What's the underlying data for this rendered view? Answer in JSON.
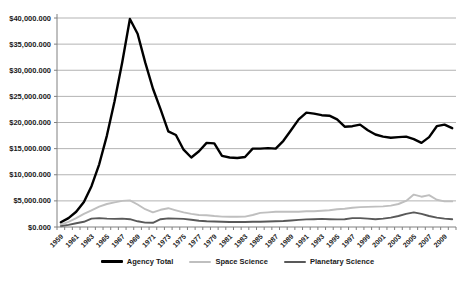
{
  "chart_data": {
    "type": "line",
    "title": "",
    "xlabel": "",
    "ylabel": "",
    "ylim": [
      0,
      40000
    ],
    "grid": "horizontal",
    "legend_position": "bottom",
    "axis_color": "#808080",
    "gridline_color": "#b3b3b3",
    "text_color": "#1a1a1a",
    "y_ticks": [
      0,
      5000,
      10000,
      15000,
      20000,
      25000,
      30000,
      35000,
      40000
    ],
    "y_tick_labels": [
      "$0.000",
      "$5,000.000",
      "$10,000.000",
      "$15,000.000",
      "$20,000.000",
      "$25,000.000",
      "$30,000.000",
      "$35,000.000",
      "$40,000.000"
    ],
    "x": [
      1959,
      1960,
      1961,
      1962,
      1963,
      1964,
      1965,
      1966,
      1967,
      1968,
      1969,
      1970,
      1971,
      1972,
      1973,
      1974,
      1975,
      1976,
      1977,
      1978,
      1979,
      1980,
      1981,
      1982,
      1983,
      1984,
      1985,
      1986,
      1987,
      1988,
      1989,
      1990,
      1991,
      1992,
      1993,
      1994,
      1995,
      1996,
      1997,
      1998,
      1999,
      2000,
      2001,
      2002,
      2003,
      2004,
      2005,
      2006,
      2007,
      2008,
      2009,
      2010
    ],
    "x_tick_labels": [
      "1959",
      "1961",
      "1963",
      "1965",
      "1967",
      "1969",
      "1971",
      "1973",
      "1975",
      "1977",
      "1979",
      "1981",
      "1983",
      "1985",
      "1987",
      "1989",
      "1991",
      "1993",
      "1995",
      "1997",
      "1999",
      "2001",
      "2003",
      "2005",
      "2007",
      "2009"
    ],
    "series": [
      {
        "name": "Agency Total",
        "color": "#000000",
        "stroke_width": 2.4,
        "values": [
          900,
          1700,
          2900,
          4800,
          7800,
          12000,
          17500,
          24000,
          31500,
          39800,
          37000,
          31500,
          26500,
          22500,
          18300,
          17600,
          14800,
          13300,
          14500,
          16100,
          16000,
          13600,
          13300,
          13200,
          13400,
          15000,
          15000,
          15100,
          15000,
          16500,
          18500,
          20600,
          21900,
          21700,
          21400,
          21300,
          20600,
          19200,
          19300,
          19600,
          18500,
          17700,
          17300,
          17100,
          17200,
          17300,
          16800,
          16100,
          17200,
          19300,
          19600,
          18900
        ]
      },
      {
        "name": "Space Science",
        "color": "#bfbfbf",
        "stroke_width": 1.9,
        "values": [
          450,
          1000,
          1700,
          2500,
          3200,
          3900,
          4400,
          4700,
          5000,
          5100,
          4300,
          3400,
          2800,
          3300,
          3600,
          3200,
          2800,
          2500,
          2300,
          2250,
          2100,
          2000,
          1950,
          1950,
          2000,
          2300,
          2700,
          2800,
          2900,
          2900,
          2900,
          2900,
          3000,
          3000,
          3100,
          3200,
          3400,
          3500,
          3700,
          3800,
          3850,
          3900,
          3950,
          4100,
          4400,
          5000,
          6200,
          5800,
          6100,
          5200,
          4900,
          4900
        ]
      },
      {
        "name": "Planetary Science",
        "color": "#595959",
        "stroke_width": 1.9,
        "values": [
          150,
          400,
          700,
          1000,
          1600,
          1700,
          1600,
          1550,
          1600,
          1500,
          1100,
          850,
          800,
          1500,
          1650,
          1600,
          1550,
          1400,
          1200,
          1100,
          1050,
          1000,
          950,
          950,
          950,
          1000,
          1000,
          1050,
          1100,
          1150,
          1250,
          1350,
          1450,
          1500,
          1550,
          1500,
          1450,
          1500,
          1700,
          1700,
          1600,
          1500,
          1600,
          1800,
          2100,
          2500,
          2800,
          2500,
          2100,
          1800,
          1600,
          1500
        ]
      }
    ],
    "legend_entries": [
      "Agency Total",
      "Space Science",
      "Planetary Science"
    ]
  }
}
